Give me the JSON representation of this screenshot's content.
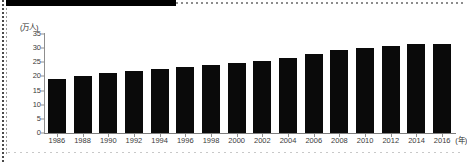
{
  "page": {
    "background_color": "#ffffff",
    "frame_color": "#4a4a4a"
  },
  "chart_data": {
    "type": "bar",
    "title": "",
    "subtitle": "",
    "xlabel": "(年)",
    "ylabel": "(万人)",
    "categories": [
      "1986",
      "1988",
      "1990",
      "1992",
      "1994",
      "1996",
      "1998",
      "2000",
      "2002",
      "2004",
      "2006",
      "2008",
      "2010",
      "2012",
      "2014",
      "2016"
    ],
    "values": [
      19.1,
      20.2,
      21.1,
      21.9,
      22.6,
      23.3,
      24.1,
      24.8,
      25.6,
      26.4,
      27.9,
      29.2,
      29.9,
      30.8,
      31.3,
      31.6
    ],
    "series": [
      {
        "name": "人数",
        "values": [
          19.1,
          20.2,
          21.1,
          21.9,
          22.6,
          23.3,
          24.1,
          24.8,
          25.6,
          26.4,
          27.9,
          29.2,
          29.9,
          30.8,
          31.3,
          31.6
        ]
      }
    ],
    "ylim": [
      0,
      35
    ],
    "yticks": [
      0,
      5,
      10,
      15,
      20,
      25,
      30,
      35
    ],
    "ytick_labels": [
      "0",
      "5",
      "10",
      "15",
      "20",
      "25",
      "30",
      "35"
    ],
    "xtick_labels": [
      "1986",
      "1988",
      "1990",
      "1992",
      "1994",
      "1996",
      "1998",
      "2000",
      "2002",
      "2004",
      "2006",
      "2008",
      "2010",
      "2012",
      "2014",
      "2016"
    ],
    "grid": false,
    "legend": null,
    "legend_position": "none",
    "bar_color": "#0a0a0a",
    "axis_color": "#8e8e8e",
    "annotations": []
  }
}
